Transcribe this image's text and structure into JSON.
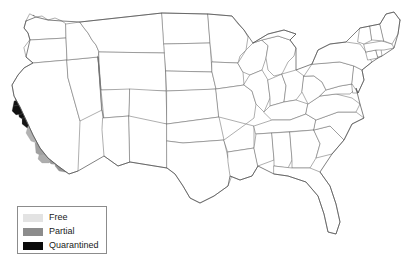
{
  "map": {
    "title": "United States quarantine status map",
    "background_color": "#ffffff",
    "state_border_color": "#6d6d6d",
    "nation_border_color": "#4a4a4a"
  },
  "legend": {
    "items": [
      {
        "label": "Free",
        "color": "#e3e3e3"
      },
      {
        "label": "Partial",
        "color": "#8c8c8c"
      },
      {
        "label": "Quarantined",
        "color": "#0a0a0a"
      }
    ]
  },
  "regions": [
    {
      "name": "california-north-coast-free",
      "status": "Free",
      "color": "#e0e0e0"
    },
    {
      "name": "california-sacramento-valley-free",
      "status": "Free",
      "color": "#dedede"
    },
    {
      "name": "california-bay-area-quarantined",
      "status": "Quarantined",
      "color": "#101010"
    },
    {
      "name": "california-santa-cruz-quarantined",
      "status": "Quarantined",
      "color": "#161616"
    },
    {
      "name": "california-monterey-quarantined",
      "status": "Quarantined",
      "color": "#1c1c1c"
    },
    {
      "name": "california-central-valley-partial",
      "status": "Partial",
      "color": "#a8a8a8"
    },
    {
      "name": "california-san-joaquin-partial",
      "status": "Partial",
      "color": "#c2c2c2"
    },
    {
      "name": "california-south-coast-partial",
      "status": "Partial",
      "color": "#9b9b9b"
    },
    {
      "name": "california-san-diego-partial",
      "status": "Partial",
      "color": "#a2a2a2"
    },
    {
      "name": "nebraska-east-free",
      "status": "Free",
      "color": "#d8d8d8"
    }
  ]
}
